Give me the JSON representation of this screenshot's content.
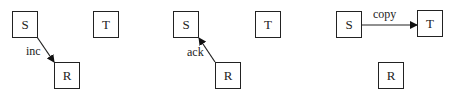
{
  "panels": [
    {
      "nodes": {
        "S": "S",
        "T": "T",
        "R": "R"
      },
      "edge": {
        "from": "S",
        "to": "R",
        "label": "inc"
      }
    },
    {
      "nodes": {
        "S": "S",
        "T": "T",
        "R": "R"
      },
      "edge": {
        "from": "R",
        "to": "S",
        "label": "ack"
      }
    },
    {
      "nodes": {
        "S": "S",
        "T": "T",
        "R": "R"
      },
      "edge": {
        "from": "S",
        "to": "T",
        "label": "copy"
      }
    }
  ],
  "colors": {
    "stroke": "#222222",
    "background": "#ffffff"
  }
}
